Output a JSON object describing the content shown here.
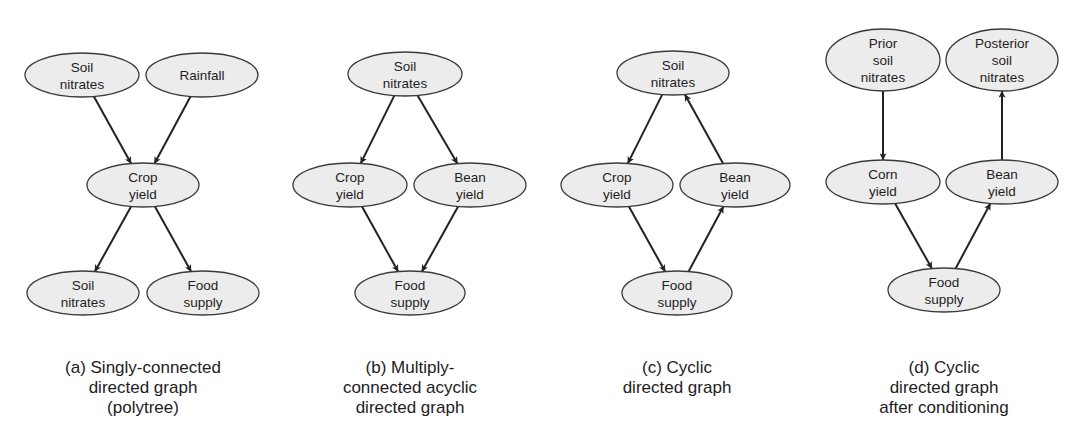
{
  "figure": {
    "colors": {
      "node_fill": "#ececec",
      "node_stroke": "#3a3a3a",
      "edge": "#222222",
      "text": "#1e1e1e"
    },
    "panels": [
      {
        "id": "a",
        "caption_lines": [
          "(a) Singly-connected",
          "directed graph",
          "(polytree)"
        ],
        "caption_center_x": 143,
        "nodes": [
          {
            "id": "a_soil_top",
            "lines": [
              "Soil",
              "nitrates"
            ],
            "cx": 82,
            "cy": 75,
            "rx": 57,
            "ry": 22
          },
          {
            "id": "a_rainfall",
            "lines": [
              "Rainfall"
            ],
            "cx": 202,
            "cy": 75,
            "rx": 56,
            "ry": 22
          },
          {
            "id": "a_crop",
            "lines": [
              "Crop",
              "yield"
            ],
            "cx": 143,
            "cy": 185,
            "rx": 56,
            "ry": 22
          },
          {
            "id": "a_soil_bottom",
            "lines": [
              "Soil",
              "nitrates"
            ],
            "cx": 83,
            "cy": 293,
            "rx": 56,
            "ry": 22
          },
          {
            "id": "a_food",
            "lines": [
              "Food",
              "supply"
            ],
            "cx": 203,
            "cy": 293,
            "rx": 56,
            "ry": 22
          }
        ],
        "edges": [
          {
            "from": "a_soil_top",
            "to": "a_crop"
          },
          {
            "from": "a_rainfall",
            "to": "a_crop"
          },
          {
            "from": "a_crop",
            "to": "a_soil_bottom"
          },
          {
            "from": "a_crop",
            "to": "a_food"
          }
        ]
      },
      {
        "id": "b",
        "caption_lines": [
          "(b) Multiply-",
          "connected acyclic",
          "directed graph"
        ],
        "caption_center_x": 410,
        "nodes": [
          {
            "id": "b_soil",
            "lines": [
              "Soil",
              "nitrates"
            ],
            "cx": 405,
            "cy": 74,
            "rx": 57,
            "ry": 22
          },
          {
            "id": "b_crop",
            "lines": [
              "Crop",
              "yield"
            ],
            "cx": 350,
            "cy": 185,
            "rx": 57,
            "ry": 22
          },
          {
            "id": "b_bean",
            "lines": [
              "Bean",
              "yield"
            ],
            "cx": 470,
            "cy": 185,
            "rx": 56,
            "ry": 22
          },
          {
            "id": "b_food",
            "lines": [
              "Food",
              "supply"
            ],
            "cx": 410,
            "cy": 293,
            "rx": 55,
            "ry": 22
          }
        ],
        "edges": [
          {
            "from": "b_soil",
            "to": "b_crop"
          },
          {
            "from": "b_soil",
            "to": "b_bean"
          },
          {
            "from": "b_crop",
            "to": "b_food"
          },
          {
            "from": "b_bean",
            "to": "b_food"
          }
        ]
      },
      {
        "id": "c",
        "caption_lines": [
          "(c) Cyclic",
          "directed graph"
        ],
        "caption_center_x": 677,
        "nodes": [
          {
            "id": "c_soil",
            "lines": [
              "Soil",
              "nitrates"
            ],
            "cx": 673,
            "cy": 73,
            "rx": 56,
            "ry": 22
          },
          {
            "id": "c_crop",
            "lines": [
              "Crop",
              "yield"
            ],
            "cx": 617,
            "cy": 185,
            "rx": 56,
            "ry": 22
          },
          {
            "id": "c_bean",
            "lines": [
              "Bean",
              "yield"
            ],
            "cx": 735,
            "cy": 185,
            "rx": 55,
            "ry": 22
          },
          {
            "id": "c_food",
            "lines": [
              "Food",
              "supply"
            ],
            "cx": 677,
            "cy": 293,
            "rx": 55,
            "ry": 22
          }
        ],
        "edges": [
          {
            "from": "c_soil",
            "to": "c_crop"
          },
          {
            "from": "c_bean",
            "to": "c_soil"
          },
          {
            "from": "c_crop",
            "to": "c_food"
          },
          {
            "from": "c_food",
            "to": "c_bean"
          }
        ]
      },
      {
        "id": "d",
        "caption_lines": [
          "(d) Cyclic",
          "directed graph",
          "after conditioning"
        ],
        "caption_center_x": 944,
        "nodes": [
          {
            "id": "d_prior",
            "lines": [
              "Prior",
              "soil",
              "nitrates"
            ],
            "cx": 883,
            "cy": 60,
            "rx": 57,
            "ry": 31
          },
          {
            "id": "d_posterior",
            "lines": [
              "Posterior",
              "soil",
              "nitrates"
            ],
            "cx": 1002,
            "cy": 60,
            "rx": 56,
            "ry": 31
          },
          {
            "id": "d_corn",
            "lines": [
              "Corn",
              "yield"
            ],
            "cx": 883,
            "cy": 182,
            "rx": 57,
            "ry": 22
          },
          {
            "id": "d_bean",
            "lines": [
              "Bean",
              "yield"
            ],
            "cx": 1002,
            "cy": 182,
            "rx": 56,
            "ry": 22
          },
          {
            "id": "d_food",
            "lines": [
              "Food",
              "supply"
            ],
            "cx": 944,
            "cy": 290,
            "rx": 56,
            "ry": 22
          }
        ],
        "edges": [
          {
            "from": "d_prior",
            "to": "d_corn"
          },
          {
            "from": "d_bean",
            "to": "d_posterior"
          },
          {
            "from": "d_corn",
            "to": "d_food"
          },
          {
            "from": "d_food",
            "to": "d_bean"
          }
        ]
      }
    ]
  }
}
